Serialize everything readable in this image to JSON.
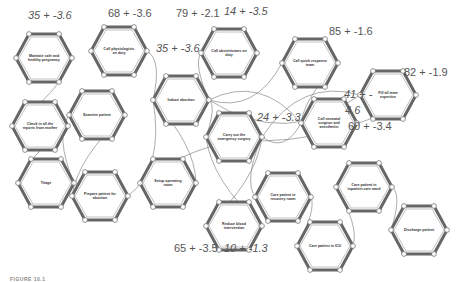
{
  "diagram": {
    "type": "flow-network",
    "nodes": [
      {
        "id": "n1",
        "label": "Maintain safe and healthy pregnancy",
        "x": 44,
        "y": 58
      },
      {
        "id": "n2",
        "label": "Call physiologists on duty",
        "x": 119,
        "y": 51
      },
      {
        "id": "n3",
        "label": "Check in all the reports from mother",
        "x": 40,
        "y": 126
      },
      {
        "id": "n4",
        "label": "Examine patient",
        "x": 97,
        "y": 115
      },
      {
        "id": "n5",
        "label": "Triage",
        "x": 46,
        "y": 183
      },
      {
        "id": "n6",
        "label": "Prepare patient for abortion",
        "x": 100,
        "y": 196
      },
      {
        "id": "n7",
        "label": "Induce abortion",
        "x": 181,
        "y": 100
      },
      {
        "id": "n8",
        "label": "Call obstetricians on duty",
        "x": 229,
        "y": 53
      },
      {
        "id": "n9",
        "label": "Carry out the emergency surgery",
        "x": 234,
        "y": 137
      },
      {
        "id": "n10",
        "label": "Setup operating room",
        "x": 168,
        "y": 183
      },
      {
        "id": "n11",
        "label": "Reduce blood intervention",
        "x": 234,
        "y": 226
      },
      {
        "id": "n12",
        "label": "Call quick response team",
        "x": 310,
        "y": 63
      },
      {
        "id": "n13",
        "label": "Call neonatal surgeon and anesthetist",
        "x": 329,
        "y": 123
      },
      {
        "id": "n14",
        "label": "Fill all team expertise",
        "x": 388,
        "y": 95
      },
      {
        "id": "n15",
        "label": "Care patient in recovery room",
        "x": 283,
        "y": 197
      },
      {
        "id": "n16",
        "label": "Care patient in ICU",
        "x": 325,
        "y": 246
      },
      {
        "id": "n17",
        "label": "Care patient in inpatient care ward",
        "x": 364,
        "y": 187
      },
      {
        "id": "n18",
        "label": "Discharge patient",
        "x": 419,
        "y": 230
      }
    ],
    "edges": [
      [
        "n1",
        "n3"
      ],
      [
        "n3",
        "n5"
      ],
      [
        "n5",
        "n4"
      ],
      [
        "n4",
        "n6"
      ],
      [
        "n2",
        "n7"
      ],
      [
        "n6",
        "n7"
      ],
      [
        "n7",
        "n8"
      ],
      [
        "n7",
        "n12"
      ],
      [
        "n7",
        "n13"
      ],
      [
        "n7",
        "n14"
      ],
      [
        "n7",
        "n9"
      ],
      [
        "n9",
        "n10"
      ],
      [
        "n9",
        "n11"
      ],
      [
        "n9",
        "n13"
      ],
      [
        "n9",
        "n14"
      ],
      [
        "n10",
        "n7"
      ],
      [
        "n11",
        "n9"
      ],
      [
        "n12",
        "n13"
      ],
      [
        "n14",
        "n9"
      ],
      [
        "n9",
        "n15"
      ],
      [
        "n15",
        "n16"
      ],
      [
        "n16",
        "n17"
      ],
      [
        "n17",
        "n18"
      ]
    ],
    "scores": [
      {
        "text": "35 + -3.6",
        "x": 28,
        "y": 18,
        "italic": true
      },
      {
        "text": "68 + -3.6",
        "x": 108,
        "y": 16,
        "italic": false
      },
      {
        "text": "79 + -2.1",
        "x": 176,
        "y": 16,
        "italic": false
      },
      {
        "text": "14 + -3.5",
        "x": 224,
        "y": 14,
        "italic": true
      },
      {
        "text": "35 + -3.6",
        "x": 156,
        "y": 51,
        "italic": true
      },
      {
        "text": "85 + -1.6",
        "x": 329,
        "y": 34,
        "italic": false
      },
      {
        "text": "82 + -1.9",
        "x": 404,
        "y": 75,
        "italic": false
      },
      {
        "text": "41 + -",
        "x": 344,
        "y": 97,
        "italic": true
      },
      {
        "text": "4.6",
        "x": 345,
        "y": 113,
        "italic": true
      },
      {
        "text": "24 + -3.3",
        "x": 257,
        "y": 120,
        "italic": true
      },
      {
        "text": "60 + -3.4",
        "x": 348,
        "y": 129,
        "italic": false
      },
      {
        "text": "65 + -3.5",
        "x": 174,
        "y": 251,
        "italic": false
      },
      {
        "text": "10 + -1.3",
        "x": 224,
        "y": 251,
        "italic": true
      }
    ],
    "caption": "FIGURE 10.1"
  },
  "colors": {
    "hex_stroke": "#666666",
    "hex_inner": "#999999",
    "edge": "#888888",
    "text": "#333333"
  }
}
